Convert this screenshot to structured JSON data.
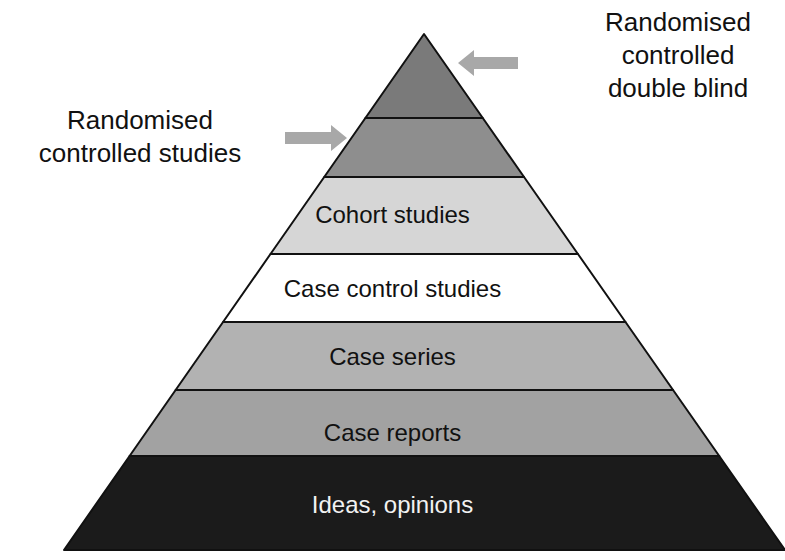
{
  "diagram": {
    "type": "evidence-pyramid",
    "apex": {
      "x": 424,
      "y": 34
    },
    "base": {
      "left_x": 64,
      "right_x": 785,
      "y": 550
    },
    "levels": [
      {
        "label": "",
        "top_y": 34,
        "bottom_y": 118,
        "fill": "#7a7a7a",
        "text_color": "#111111"
      },
      {
        "label": "",
        "top_y": 118,
        "bottom_y": 177,
        "fill": "#8e8e8e",
        "text_color": "#111111"
      },
      {
        "label": "Cohort studies",
        "top_y": 177,
        "bottom_y": 254,
        "fill": "#d6d6d6",
        "text_color": "#111111"
      },
      {
        "label": "Case control studies",
        "top_y": 254,
        "bottom_y": 322,
        "fill": "#ffffff",
        "text_color": "#111111"
      },
      {
        "label": "Case series",
        "top_y": 322,
        "bottom_y": 390,
        "fill": "#b2b2b2",
        "text_color": "#111111"
      },
      {
        "label": "Case reports",
        "top_y": 390,
        "bottom_y": 456,
        "fill": "#a2a2a2",
        "text_color": "#111111"
      },
      {
        "label": "Ideas, opinions",
        "top_y": 456,
        "bottom_y": 550,
        "fill": "#1b1b1b",
        "text_color": "#f2f2f2"
      }
    ],
    "annotations": [
      {
        "id": "rct-double-blind",
        "lines": [
          "Randomised",
          "controlled",
          "double blind"
        ],
        "arrow": {
          "from_x": 518,
          "to_x": 458,
          "y": 63,
          "direction": "left"
        }
      },
      {
        "id": "rct",
        "lines": [
          "Randomised",
          "controlled studies"
        ],
        "arrow": {
          "from_x": 285,
          "to_x": 347,
          "y": 138,
          "direction": "right"
        }
      }
    ],
    "arrow_color": "#a8a8a8",
    "outline_color": "#111111"
  },
  "labels": {
    "level_3": "Cohort studies",
    "level_4": "Case control studies",
    "level_5": "Case series",
    "level_6": "Case reports",
    "level_7": "Ideas, opinions",
    "right_annotation": {
      "line1": "Randomised",
      "line2": "controlled",
      "line3": "double blind"
    },
    "left_annotation": {
      "line1": "Randomised",
      "line2": "controlled studies"
    }
  }
}
